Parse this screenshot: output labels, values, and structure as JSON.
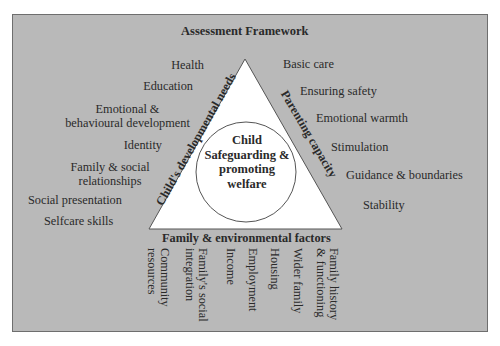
{
  "title": "Assessment Framework",
  "center": {
    "lines": [
      "Child",
      "Safeguarding &",
      "promoting",
      "welfare"
    ]
  },
  "sides": {
    "left": "Child's developmental needs",
    "right": "Parenting capacity",
    "bottom": "Family & environmental factors"
  },
  "child_needs": [
    {
      "lines": [
        "Health"
      ]
    },
    {
      "lines": [
        "Education"
      ]
    },
    {
      "lines": [
        "Emotional &",
        "behavioural development"
      ]
    },
    {
      "lines": [
        "Identity"
      ]
    },
    {
      "lines": [
        "Family & social",
        "relationships"
      ]
    },
    {
      "lines": [
        "Social presentation"
      ]
    },
    {
      "lines": [
        "Selfcare skills"
      ]
    }
  ],
  "parenting": [
    {
      "lines": [
        "Basic care"
      ]
    },
    {
      "lines": [
        "Ensuring safety"
      ]
    },
    {
      "lines": [
        "Emotional warmth"
      ]
    },
    {
      "lines": [
        "Stimulation"
      ]
    },
    {
      "lines": [
        "Guidance & boundaries"
      ]
    },
    {
      "lines": [
        "Stability"
      ]
    }
  ],
  "family_factors": [
    {
      "lines": [
        "Community",
        "resources"
      ]
    },
    {
      "lines": [
        "Family's social",
        "integration"
      ]
    },
    {
      "lines": [
        "Income"
      ]
    },
    {
      "lines": [
        "Employment"
      ]
    },
    {
      "lines": [
        "Housing"
      ]
    },
    {
      "lines": [
        "Wider family"
      ]
    },
    {
      "lines": [
        "Family history",
        "& functioning"
      ]
    }
  ],
  "colors": {
    "background": "#b9b9b9",
    "triangle_fill": "#ffffff",
    "outline": "#555555"
  }
}
